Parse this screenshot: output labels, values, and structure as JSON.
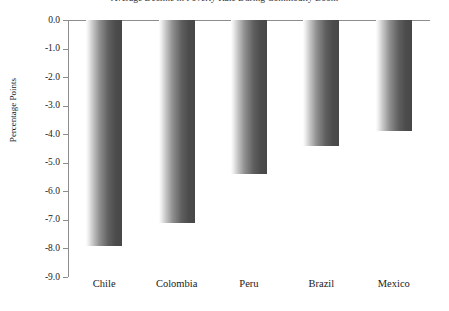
{
  "chart_data": {
    "type": "bar",
    "title": "Average Decline in Poverty Rate During Commodity Boom",
    "xlabel": "",
    "ylabel": "Percentage Points",
    "categories": [
      "Chile",
      "Colombia",
      "Peru",
      "Brazil",
      "Mexico"
    ],
    "values": [
      -7.9,
      -7.1,
      -5.4,
      -4.4,
      -3.9
    ],
    "ylim": [
      -9.0,
      0.0
    ],
    "ytick_labels": [
      "0.0",
      "-1.0",
      "-2.0",
      "-3.0",
      "-4.0",
      "-5.0",
      "-6.0",
      "-7.0",
      "-8.0",
      "-9.0"
    ],
    "ytick_values": [
      0.0,
      -1.0,
      -2.0,
      -3.0,
      -4.0,
      -5.0,
      -6.0,
      -7.0,
      -8.0,
      -9.0
    ],
    "grid": false,
    "legend": null,
    "bar_style": {
      "orientation": "vertical",
      "gradient": "horizontal-light-to-dark",
      "color_light": "#fdfdfd",
      "color_dark": "#474747",
      "axis_color": "#8d8d8d"
    }
  }
}
